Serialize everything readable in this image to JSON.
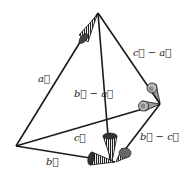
{
  "diagram": {
    "type": "vector-tetrahedron",
    "points": {
      "O": [
        16,
        146
      ],
      "A": [
        98,
        13
      ],
      "B": [
        115,
        162
      ],
      "C": [
        160,
        104
      ]
    },
    "vectors": [
      {
        "id": "a",
        "from": "O",
        "to": "A",
        "label": "a⃗"
      },
      {
        "id": "b",
        "from": "O",
        "to": "B",
        "label": "b⃗"
      },
      {
        "id": "c",
        "from": "O",
        "to": "C",
        "label": "c⃗"
      },
      {
        "id": "c_minus_a",
        "from": "A",
        "to": "C",
        "label": "c⃗ − a⃗"
      },
      {
        "id": "b_minus_a",
        "from": "A",
        "to": "B",
        "label": "b⃗ − a⃗"
      },
      {
        "id": "b_minus_c",
        "from": "C",
        "to": "B",
        "label": "b⃗ − c⃗"
      }
    ],
    "labels": {
      "a": "a⃗",
      "b": "b⃗",
      "c": "c⃗",
      "c_minus_a": "c⃗ − a⃗",
      "b_minus_a": "b⃗ − a⃗",
      "b_minus_c": "b⃗ − c⃗"
    },
    "colors": {
      "line": "#1a1a1a",
      "cone": "#555555",
      "cone_light": "#bbbbbb"
    }
  }
}
